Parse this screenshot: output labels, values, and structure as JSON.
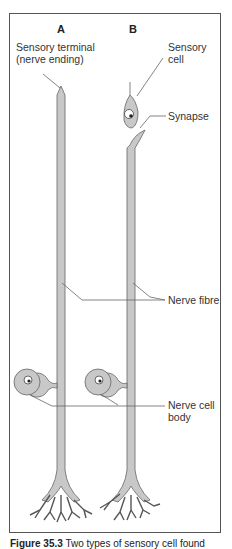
{
  "diagram": {
    "panels": [
      {
        "id": "A",
        "label": "A"
      },
      {
        "id": "B",
        "label": "B"
      }
    ],
    "labels": {
      "sensory_terminal_line1": "Sensory terminal",
      "sensory_terminal_line2": "(nerve ending)",
      "sensory_cell_line1": "Sensory",
      "sensory_cell_line2": "cell",
      "synapse": "Synapse",
      "nerve_fibre": "Nerve fibre",
      "nerve_cell_body_line1": "Nerve cell",
      "nerve_cell_body_line2": "body"
    },
    "caption": {
      "figure_number": "Figure 35.3",
      "text": " Two types of sensory cell found"
    },
    "colors": {
      "cell_fill": "#c8c8c8",
      "outline": "#555555",
      "leader_line": "#666666"
    }
  }
}
